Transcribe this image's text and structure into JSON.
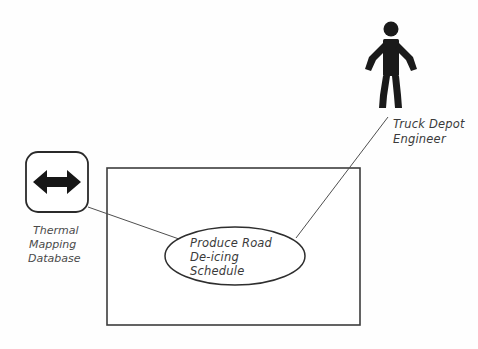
{
  "diagram": {
    "kind": "uml-use-case-diagram",
    "background_color": "#fefefe",
    "stroke_color": "#3d3d3d",
    "text_color": "#3a3a3a",
    "actor": {
      "name": "truck-depot-engineer",
      "label_line1": "Truck Depot",
      "label_line2": "Engineer",
      "full_label": "Truck Depot Engineer",
      "icon": "stick-figure-actor-icon",
      "fill_color": "#1a1a1a"
    },
    "database_node": {
      "name": "thermal-mapping-database",
      "label_line1": "Thermal",
      "label_line2": "Mapping",
      "label_line3": "Database",
      "full_label": "Thermal Mapping Database",
      "icon": "double-headed-arrow-icon",
      "shape": "rounded-rectangle"
    },
    "system_boundary": {
      "name": "system-boundary",
      "label": ""
    },
    "use_case": {
      "name": "produce-road-de-icing-schedule",
      "label_line1": "Produce Road",
      "label_line2": "De-icing",
      "label_line3": "Schedule",
      "full_label": "Produce Road De-icing Schedule",
      "shape": "ellipse"
    },
    "associations": [
      {
        "name": "association-engineer-to-usecase",
        "from": "truck-depot-engineer",
        "to": "produce-road-de-icing-schedule"
      },
      {
        "name": "association-database-to-usecase",
        "from": "thermal-mapping-database",
        "to": "produce-road-de-icing-schedule"
      }
    ]
  }
}
